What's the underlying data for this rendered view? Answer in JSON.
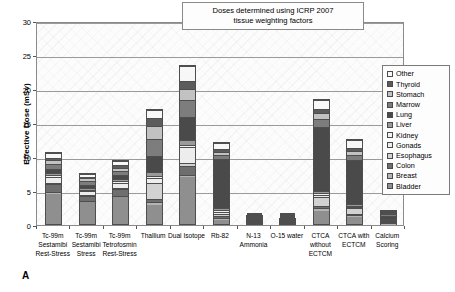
{
  "chart_data": {
    "type": "bar",
    "stacked": true,
    "title": "",
    "panel_letter": "A",
    "annotation": "Doses determined using ICRP 2007 tissue weighting factors",
    "annotation_line1": "Doses determined using ICRP 2007",
    "annotation_line2": "tissue weighting factors",
    "xlabel": "",
    "ylabel": "Effective Dose (mSv)",
    "ylim": [
      0,
      30
    ],
    "yticks": [
      0,
      5,
      10,
      15,
      20,
      25,
      30
    ],
    "grid": true,
    "legend_position": "right",
    "categories": [
      "Tc-99m Sestamibi Rest-Stress",
      "Tc-99m Sestamibi Stress",
      "Tc-99m Tetrofosmin Rest-Stress",
      "Thallium",
      "Dual Isotope",
      "Rb-82",
      "N-13 Ammonia",
      "O-15 water",
      "CTCA without ECTCM",
      "CTCA with ECTCM",
      "Calcium Scoring"
    ],
    "category_lines": [
      [
        "Tc-99m",
        "Sestamibi",
        "Rest-Stress"
      ],
      [
        "Tc-99m",
        "Sestamibi",
        "Stress"
      ],
      [
        "Tc-99m",
        "Tetrofosmin",
        "Rest-Stress"
      ],
      [
        "Thallium"
      ],
      [
        "Dual Isotope"
      ],
      [
        "Rb-82"
      ],
      [
        "N-13",
        "Ammonia"
      ],
      [
        "O-15 water"
      ],
      [
        "CTCA",
        "without",
        "ECTCM"
      ],
      [
        "CTCA with",
        "ECTCM"
      ],
      [
        "Calcium",
        "Scoring"
      ]
    ],
    "totals": [
      10.7,
      7.7,
      9.6,
      17.0,
      23.5,
      12.2,
      1.4,
      1.1,
      18.5,
      12.6,
      2.2
    ],
    "series": [
      {
        "name": "Bladder",
        "color": "#8f8f8f",
        "values": [
          4.6,
          3.35,
          4.1,
          2.8,
          7.0,
          0.55,
          0.55,
          0.35,
          1.9,
          1.0,
          0.0
        ]
      },
      {
        "name": "Breast",
        "color": "#b4b4b4",
        "values": [
          0.2,
          0.15,
          0.2,
          0.45,
          0.35,
          0.3,
          0.06,
          0.05,
          0.55,
          0.35,
          0.1
        ]
      },
      {
        "name": "Colon",
        "color": "#6e6e6e",
        "values": [
          1.2,
          0.8,
          1.0,
          0.55,
          1.3,
          0.3,
          0.08,
          0.06,
          0.25,
          0.15,
          0.05
        ]
      },
      {
        "name": "Esophagus",
        "color": "#d2d2d2",
        "values": [
          0.25,
          0.2,
          0.25,
          2.4,
          0.45,
          0.35,
          0.06,
          0.05,
          1.4,
          0.85,
          0.2
        ]
      },
      {
        "name": "Gonads",
        "color": "#ededed",
        "values": [
          0.85,
          0.6,
          0.75,
          0.65,
          2.3,
          0.3,
          0.07,
          0.05,
          0.3,
          0.2,
          0.05
        ]
      },
      {
        "name": "Kidney",
        "color": "#f2f2f2",
        "values": [
          0.25,
          0.18,
          0.22,
          0.35,
          0.4,
          0.25,
          0.05,
          0.04,
          0.2,
          0.15,
          0.05
        ]
      },
      {
        "name": "Liver",
        "color": "#9a9a9a",
        "values": [
          0.4,
          0.3,
          0.35,
          0.55,
          0.7,
          0.3,
          0.07,
          0.05,
          0.35,
          0.25,
          0.1
        ]
      },
      {
        "name": "Lung",
        "color": "#4a4a4a",
        "values": [
          0.6,
          0.45,
          0.55,
          2.45,
          3.4,
          7.4,
          0.22,
          0.18,
          9.6,
          6.7,
          0.9
        ]
      },
      {
        "name": "Marrow",
        "color": "#7d7d7d",
        "values": [
          0.75,
          0.55,
          0.65,
          2.55,
          2.6,
          0.6,
          0.12,
          0.09,
          1.15,
          0.8,
          0.25
        ]
      },
      {
        "name": "Stomach",
        "color": "#c2c2c2",
        "values": [
          0.55,
          0.4,
          0.5,
          1.85,
          1.55,
          0.45,
          0.07,
          0.05,
          0.9,
          0.6,
          0.2
        ]
      },
      {
        "name": "Thyroid",
        "color": "#5c5c5c",
        "values": [
          0.35,
          0.27,
          0.33,
          1.25,
          1.25,
          0.45,
          0.03,
          0.02,
          0.55,
          0.4,
          0.1
        ]
      },
      {
        "name": "Other",
        "color": "#f7f7f7",
        "values": [
          0.7,
          0.45,
          0.65,
          1.15,
          2.2,
          0.95,
          0.02,
          0.01,
          1.35,
          1.15,
          0.2
        ]
      }
    ]
  },
  "legend": {
    "items": [
      {
        "label": "Other",
        "color": "#f7f7f7"
      },
      {
        "label": "Thyroid",
        "color": "#5c5c5c"
      },
      {
        "label": "Stomach",
        "color": "#c2c2c2"
      },
      {
        "label": "Marrow",
        "color": "#7d7d7d"
      },
      {
        "label": "Lung",
        "color": "#4a4a4a"
      },
      {
        "label": "Liver",
        "color": "#9a9a9a"
      },
      {
        "label": "Kidney",
        "color": "#f2f2f2"
      },
      {
        "label": "Gonads",
        "color": "#ededed"
      },
      {
        "label": "Esophagus",
        "color": "#d2d2d2"
      },
      {
        "label": "Colon",
        "color": "#6e6e6e"
      },
      {
        "label": "Breast",
        "color": "#b4b4b4"
      },
      {
        "label": "Bladder",
        "color": "#8f8f8f"
      }
    ]
  }
}
